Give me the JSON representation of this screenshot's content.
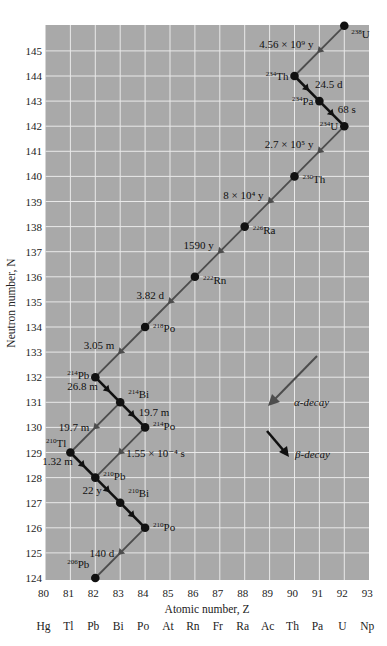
{
  "figure": {
    "x_axis_title": "Atomic number, Z",
    "y_axis_title": "Neutron number, N",
    "legend": {
      "alpha_label": "α-decay",
      "beta_label": "β-decay"
    },
    "colors": {
      "background": "#a9a9a9",
      "grid": "#e9e9e9",
      "alpha_line": "#4d4d4d",
      "beta_line": "#111111",
      "dot": "#111111"
    }
  },
  "chart_data": {
    "type": "diagram",
    "xlabel": "Atomic number, Z",
    "ylabel": "Neutron number, N",
    "x_ticks": [
      80,
      81,
      82,
      83,
      84,
      85,
      86,
      87,
      88,
      89,
      90,
      91,
      92,
      93
    ],
    "x_elements": [
      "Hg",
      "Tl",
      "Pb",
      "Bi",
      "Po",
      "At",
      "Rn",
      "Fr",
      "Ra",
      "Ac",
      "Th",
      "Pa",
      "U",
      "Np"
    ],
    "y_ticks": [
      124,
      125,
      126,
      127,
      128,
      129,
      130,
      131,
      132,
      133,
      134,
      135,
      136,
      137,
      138,
      139,
      140,
      141,
      142,
      143,
      144,
      145
    ],
    "xlim": [
      80,
      93
    ],
    "ylim": [
      124,
      146
    ],
    "grid": true,
    "nuclides": [
      {
        "id": "U238",
        "mass": "238",
        "sym": "U",
        "Z": 92,
        "N": 146
      },
      {
        "id": "Th234",
        "mass": "234",
        "sym": "Th",
        "Z": 90,
        "N": 144
      },
      {
        "id": "Pa234",
        "mass": "234",
        "sym": "Pa",
        "Z": 91,
        "N": 143
      },
      {
        "id": "U234",
        "mass": "234",
        "sym": "U",
        "Z": 92,
        "N": 142
      },
      {
        "id": "Th230",
        "mass": "230",
        "sym": "Th",
        "Z": 90,
        "N": 140
      },
      {
        "id": "Ra226",
        "mass": "226",
        "sym": "Ra",
        "Z": 88,
        "N": 138
      },
      {
        "id": "Rn222",
        "mass": "222",
        "sym": "Rn",
        "Z": 86,
        "N": 136
      },
      {
        "id": "Po218",
        "mass": "218",
        "sym": "Po",
        "Z": 84,
        "N": 134
      },
      {
        "id": "Pb214",
        "mass": "214",
        "sym": "Pb",
        "Z": 82,
        "N": 132
      },
      {
        "id": "Bi214",
        "mass": "214",
        "sym": "Bi",
        "Z": 83,
        "N": 131
      },
      {
        "id": "Po214",
        "mass": "214",
        "sym": "Po",
        "Z": 84,
        "N": 130
      },
      {
        "id": "Tl210",
        "mass": "210",
        "sym": "Tl",
        "Z": 81,
        "N": 129
      },
      {
        "id": "Pb210",
        "mass": "210",
        "sym": "Pb",
        "Z": 82,
        "N": 128
      },
      {
        "id": "Bi210",
        "mass": "210",
        "sym": "Bi",
        "Z": 83,
        "N": 127
      },
      {
        "id": "Po210",
        "mass": "210",
        "sym": "Po",
        "Z": 84,
        "N": 126
      },
      {
        "id": "Pb206",
        "mass": "206",
        "sym": "Pb",
        "Z": 82,
        "N": 124
      }
    ],
    "decays": [
      {
        "from": "U238",
        "to": "Th234",
        "type": "alpha",
        "half_life": "4.56 × 10⁹ y"
      },
      {
        "from": "Th234",
        "to": "Pa234",
        "type": "beta",
        "half_life": "24.5 d"
      },
      {
        "from": "Pa234",
        "to": "U234",
        "type": "beta",
        "half_life": "68 s"
      },
      {
        "from": "U234",
        "to": "Th230",
        "type": "alpha",
        "half_life": "2.7 × 10⁵ y"
      },
      {
        "from": "Th230",
        "to": "Ra226",
        "type": "alpha",
        "half_life": "8 × 10⁴ y"
      },
      {
        "from": "Ra226",
        "to": "Rn222",
        "type": "alpha",
        "half_life": "1590 y"
      },
      {
        "from": "Rn222",
        "to": "Po218",
        "type": "alpha",
        "half_life": "3.82 d"
      },
      {
        "from": "Po218",
        "to": "Pb214",
        "type": "alpha",
        "half_life": "3.05 m"
      },
      {
        "from": "Pb214",
        "to": "Bi214",
        "type": "beta",
        "half_life": "26.8 m"
      },
      {
        "from": "Bi214",
        "to": "Po214",
        "type": "beta",
        "half_life": "19.7 m"
      },
      {
        "from": "Bi214",
        "to": "Tl210",
        "type": "alpha",
        "half_life": "19.7 m"
      },
      {
        "from": "Po214",
        "to": "Pb210",
        "type": "alpha",
        "half_life": "1.55 × 10⁻⁴ s"
      },
      {
        "from": "Tl210",
        "to": "Pb210",
        "type": "beta",
        "half_life": "1.32 m"
      },
      {
        "from": "Pb210",
        "to": "Bi210",
        "type": "beta",
        "half_life": "22 y"
      },
      {
        "from": "Bi210",
        "to": "Po210",
        "type": "beta",
        "half_life": ""
      },
      {
        "from": "Po210",
        "to": "Pb206",
        "type": "alpha",
        "half_life": "140 d"
      }
    ]
  }
}
